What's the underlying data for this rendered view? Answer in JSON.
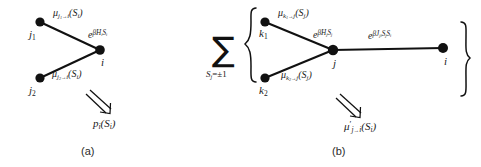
{
  "figure": {
    "background": "#ffffff",
    "ink": "#111111"
  },
  "panel_a": {
    "caption": "(a)",
    "nodes": [
      {
        "id": "j1",
        "label_parts": {
          "base": "j",
          "sub": "1"
        },
        "x": 40,
        "y": 22
      },
      {
        "id": "j2",
        "label_parts": {
          "base": "j",
          "sub": "2"
        },
        "x": 40,
        "y": 78
      },
      {
        "id": "i",
        "label_parts": {
          "base": "i",
          "sub": ""
        },
        "x": 100,
        "y": 50
      }
    ],
    "edges": [
      {
        "from": "j1",
        "to": "i"
      },
      {
        "from": "j2",
        "to": "i"
      }
    ],
    "edge_labels": {
      "top": {
        "mu": "μ",
        "sub_from": "j",
        "sub_from_idx": "1",
        "arrow": "→",
        "sub_to": "i",
        "arg": "(S",
        "arg_sub": "i",
        "arg_close": ")"
      },
      "bottom": {
        "mu": "μ",
        "sub_from": "j",
        "sub_from_idx": "2",
        "arrow": "→",
        "sub_to": "i",
        "arg": "(S",
        "arg_sub": "i",
        "arg_close": ")"
      }
    },
    "node_factor": {
      "base": "e",
      "exp_beta": "β",
      "exp_H": "H",
      "exp_H_sub": "i",
      "exp_S": "S",
      "exp_S_sub": "i"
    },
    "result": {
      "p": "p",
      "p_sub": "i",
      "arg": "(S",
      "arg_sub": "i",
      "arg_close": ")"
    }
  },
  "panel_b": {
    "caption": "(b)",
    "sum": {
      "symbol": "∑",
      "subscript_var": "S",
      "subscript_var_sub": "j",
      "subscript_rest": "=±1"
    },
    "brace_left": "{",
    "brace_right": "}",
    "nodes": [
      {
        "id": "k1",
        "label_parts": {
          "base": "k",
          "sub": "1"
        },
        "x": 265,
        "y": 22
      },
      {
        "id": "k2",
        "label_parts": {
          "base": "k",
          "sub": "2"
        },
        "x": 265,
        "y": 78
      },
      {
        "id": "j",
        "label_parts": {
          "base": "j",
          "sub": ""
        },
        "x": 333,
        "y": 50
      },
      {
        "id": "i",
        "label_parts": {
          "base": "i",
          "sub": ""
        },
        "x": 443,
        "y": 48
      }
    ],
    "edges": [
      {
        "from": "k1",
        "to": "j"
      },
      {
        "from": "k2",
        "to": "j"
      },
      {
        "from": "j",
        "to": "i"
      }
    ],
    "edge_labels": {
      "top": {
        "mu": "μ",
        "sub_from": "k",
        "sub_from_idx": "1",
        "arrow": "→",
        "sub_to": "j",
        "arg": "(S",
        "arg_sub": "j",
        "arg_close": ")"
      },
      "bottom": {
        "mu": "μ",
        "sub_from": "k",
        "sub_from_idx": "2",
        "arrow": "→",
        "sub_to": "j",
        "arg": "(S",
        "arg_sub": "j",
        "arg_close": ")"
      }
    },
    "node_factor": {
      "base": "e",
      "exp_beta": "β",
      "exp_H": "H",
      "exp_H_sub": "j",
      "exp_S": "S",
      "exp_S_sub": "j"
    },
    "bond_factor": {
      "base": "e",
      "exp_beta": "β",
      "exp_J": "J",
      "exp_J_sub": "ji",
      "exp_S1": "S",
      "exp_S1_sub": "j",
      "exp_S2": "S",
      "exp_S2_sub": "i"
    },
    "result": {
      "mu": "μ",
      "prime": "′",
      "sub_from": "j",
      "arrow": "→",
      "sub_to": "i",
      "arg": "(S",
      "arg_sub": "i",
      "arg_close": ")"
    }
  }
}
